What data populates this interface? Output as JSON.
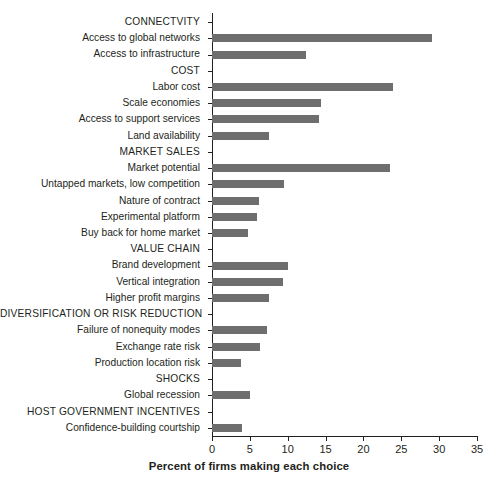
{
  "chart_data": {
    "type": "bar",
    "orientation": "horizontal",
    "title": "",
    "xlabel": "Percent of firms making each choice",
    "ylabel": "",
    "xlim": [
      0,
      35
    ],
    "xticks": [
      0,
      5,
      10,
      15,
      20,
      25,
      30,
      35
    ],
    "grid": false,
    "legend": null,
    "bar_color": "#6e6e6e",
    "axis_color": "#231f20",
    "categories": [
      "CONNECTVITY",
      "Access to global networks",
      "Access to infrastructure",
      "COST",
      "Labor cost",
      "Scale economies",
      "Access to support services",
      "Land availability",
      "MARKET SALES",
      "Market potential",
      "Untapped markets, low competition",
      "Nature of contract",
      "Experimental platform",
      "Buy back for home market",
      "VALUE CHAIN",
      "Brand development",
      "Vertical integration",
      "Higher profit margins",
      "DIVERSIFICATION OR RISK REDUCTION",
      "Failure of nonequity modes",
      "Exchange rate risk",
      "Production location risk",
      "SHOCKS",
      "Global recession",
      "HOST GOVERNMENT INCENTIVES",
      "Confidence-building courtship"
    ],
    "is_header": [
      true,
      false,
      false,
      true,
      false,
      false,
      false,
      false,
      true,
      false,
      false,
      false,
      false,
      false,
      true,
      false,
      false,
      false,
      true,
      false,
      false,
      false,
      true,
      false,
      true,
      false
    ],
    "values": [
      null,
      29.1,
      12.4,
      null,
      23.9,
      14.4,
      14.1,
      7.5,
      null,
      23.5,
      9.5,
      6.2,
      5.9,
      4.7,
      null,
      10.1,
      9.4,
      7.5,
      null,
      7.2,
      6.4,
      3.8,
      null,
      5.0,
      null,
      4.0
    ]
  }
}
